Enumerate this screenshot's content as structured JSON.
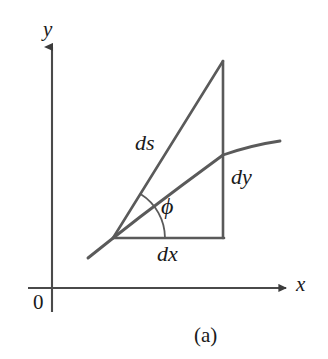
{
  "figure": {
    "caption": "(a)",
    "type": "geometric-diagram",
    "background_color": "#ffffff",
    "line_color": "#5a5a5a",
    "axis_color": "#4a4a4a",
    "text_color": "#1a1a1a"
  },
  "axes": {
    "y_axis_label": "y",
    "x_axis_label": "x",
    "origin_label": "0",
    "y_axis": {
      "x": 52,
      "y_top": 44,
      "y_bottom": 312
    },
    "x_axis": {
      "y": 288,
      "x_left": 28,
      "x_right": 290
    }
  },
  "labels": {
    "ds": "ds",
    "dy": "dy",
    "dx": "dx",
    "phi": "ϕ"
  },
  "geometry": {
    "vertex": {
      "x": 113,
      "y": 238
    },
    "apex": {
      "x": 223,
      "y": 61
    },
    "base_right": {
      "x": 223,
      "y": 238
    },
    "curve_start": {
      "x": 88,
      "y": 258
    },
    "curve_end": {
      "x": 280,
      "y": 141
    },
    "curve_control": {
      "x": 180,
      "y": 168
    },
    "angle_arc_radius": 52,
    "angle_degrees": 58
  }
}
